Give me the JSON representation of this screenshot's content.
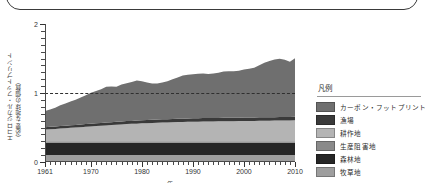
{
  "frame": {
    "present": true
  },
  "axes": {
    "y_title_line1": "エコロジカル・フットプリント",
    "y_title_line2": "（必要な地球の個数）",
    "x_title": "年",
    "y_ticks": [
      "0",
      "1",
      "2"
    ],
    "x_ticks": [
      "1961",
      "1970",
      "1980",
      "1990",
      "2000",
      "2010"
    ]
  },
  "legend": {
    "title": "凡例",
    "items": [
      {
        "label": "カーボン・フットプリント",
        "color": "#6f6f6f"
      },
      {
        "label": "漁場",
        "color": "#3a3a3a"
      },
      {
        "label": "耕作地",
        "color": "#b4b4b4"
      },
      {
        "label": "生産阻害地",
        "color": "#8a8a8a"
      },
      {
        "label": "森林地",
        "color": "#262626"
      },
      {
        "label": "牧草地",
        "color": "#9e9e9e"
      }
    ]
  },
  "chart_data": {
    "type": "area",
    "title": "",
    "xlabel": "年",
    "ylabel": "エコロジカル・フットプリント（必要な地球の個数）",
    "xlim": [
      1961,
      2010
    ],
    "ylim": [
      0,
      2
    ],
    "grid": false,
    "stacked": true,
    "legend_position": "right",
    "reference_line": {
      "y": 1.0,
      "style": "dashed",
      "color": "#2f2f2f"
    },
    "x": [
      1961,
      1962,
      1963,
      1964,
      1965,
      1966,
      1967,
      1968,
      1969,
      1970,
      1971,
      1972,
      1973,
      1974,
      1975,
      1976,
      1977,
      1978,
      1979,
      1980,
      1981,
      1982,
      1983,
      1984,
      1985,
      1986,
      1987,
      1988,
      1989,
      1990,
      1991,
      1992,
      1993,
      1994,
      1995,
      1996,
      1997,
      1998,
      1999,
      2000,
      2001,
      2002,
      2003,
      2004,
      2005,
      2006,
      2007,
      2008,
      2009,
      2010
    ],
    "series": [
      {
        "name": "牧草地",
        "color": "#9e9e9e",
        "values": [
          0.1,
          0.1,
          0.1,
          0.1,
          0.1,
          0.1,
          0.1,
          0.1,
          0.1,
          0.1,
          0.1,
          0.1,
          0.1,
          0.1,
          0.1,
          0.1,
          0.1,
          0.1,
          0.1,
          0.1,
          0.1,
          0.1,
          0.1,
          0.1,
          0.1,
          0.1,
          0.1,
          0.1,
          0.1,
          0.1,
          0.1,
          0.1,
          0.1,
          0.1,
          0.1,
          0.1,
          0.1,
          0.1,
          0.1,
          0.1,
          0.1,
          0.1,
          0.1,
          0.1,
          0.1,
          0.1,
          0.1,
          0.1,
          0.1,
          0.1
        ]
      },
      {
        "name": "森林地",
        "color": "#262626",
        "values": [
          0.18,
          0.18,
          0.18,
          0.18,
          0.18,
          0.18,
          0.18,
          0.18,
          0.18,
          0.18,
          0.18,
          0.18,
          0.18,
          0.18,
          0.18,
          0.18,
          0.18,
          0.18,
          0.18,
          0.18,
          0.18,
          0.18,
          0.18,
          0.18,
          0.18,
          0.18,
          0.18,
          0.18,
          0.18,
          0.18,
          0.18,
          0.18,
          0.18,
          0.18,
          0.18,
          0.18,
          0.18,
          0.18,
          0.18,
          0.18,
          0.18,
          0.18,
          0.18,
          0.18,
          0.18,
          0.18,
          0.18,
          0.18,
          0.18,
          0.18
        ]
      },
      {
        "name": "生産阻害地",
        "color": "#8a8a8a",
        "values": [
          0.02,
          0.02,
          0.02,
          0.02,
          0.02,
          0.02,
          0.02,
          0.02,
          0.02,
          0.02,
          0.02,
          0.02,
          0.02,
          0.02,
          0.02,
          0.02,
          0.02,
          0.02,
          0.02,
          0.02,
          0.02,
          0.02,
          0.02,
          0.02,
          0.02,
          0.02,
          0.02,
          0.02,
          0.02,
          0.02,
          0.02,
          0.02,
          0.02,
          0.02,
          0.02,
          0.02,
          0.02,
          0.02,
          0.02,
          0.02,
          0.02,
          0.02,
          0.02,
          0.02,
          0.02,
          0.02,
          0.02,
          0.02,
          0.02,
          0.02
        ]
      },
      {
        "name": "耕作地",
        "color": "#b4b4b4",
        "values": [
          0.17,
          0.175,
          0.18,
          0.185,
          0.19,
          0.195,
          0.2,
          0.205,
          0.21,
          0.215,
          0.22,
          0.225,
          0.23,
          0.235,
          0.24,
          0.245,
          0.25,
          0.253,
          0.256,
          0.26,
          0.263,
          0.266,
          0.27,
          0.272,
          0.274,
          0.276,
          0.278,
          0.28,
          0.282,
          0.284,
          0.285,
          0.286,
          0.287,
          0.288,
          0.289,
          0.29,
          0.291,
          0.292,
          0.293,
          0.294,
          0.295,
          0.296,
          0.297,
          0.298,
          0.299,
          0.3,
          0.301,
          0.302,
          0.303,
          0.304
        ]
      },
      {
        "name": "漁場",
        "color": "#3a3a3a",
        "values": [
          0.035,
          0.035,
          0.036,
          0.036,
          0.037,
          0.037,
          0.038,
          0.038,
          0.039,
          0.039,
          0.04,
          0.04,
          0.041,
          0.041,
          0.042,
          0.042,
          0.043,
          0.043,
          0.044,
          0.044,
          0.045,
          0.045,
          0.046,
          0.046,
          0.047,
          0.047,
          0.048,
          0.048,
          0.049,
          0.049,
          0.05,
          0.05,
          0.05,
          0.05,
          0.05,
          0.05,
          0.05,
          0.05,
          0.05,
          0.05,
          0.05,
          0.05,
          0.05,
          0.05,
          0.05,
          0.05,
          0.05,
          0.05,
          0.05,
          0.05
        ]
      },
      {
        "name": "カーボン・フットプリント",
        "color": "#6f6f6f",
        "values": [
          0.235,
          0.25,
          0.27,
          0.3,
          0.32,
          0.345,
          0.365,
          0.39,
          0.42,
          0.45,
          0.47,
          0.49,
          0.52,
          0.52,
          0.51,
          0.535,
          0.55,
          0.565,
          0.58,
          0.565,
          0.545,
          0.525,
          0.52,
          0.535,
          0.55,
          0.575,
          0.6,
          0.625,
          0.635,
          0.64,
          0.645,
          0.645,
          0.64,
          0.645,
          0.655,
          0.67,
          0.675,
          0.675,
          0.68,
          0.695,
          0.705,
          0.72,
          0.755,
          0.79,
          0.815,
          0.835,
          0.845,
          0.83,
          0.8,
          0.85
        ]
      }
    ]
  }
}
